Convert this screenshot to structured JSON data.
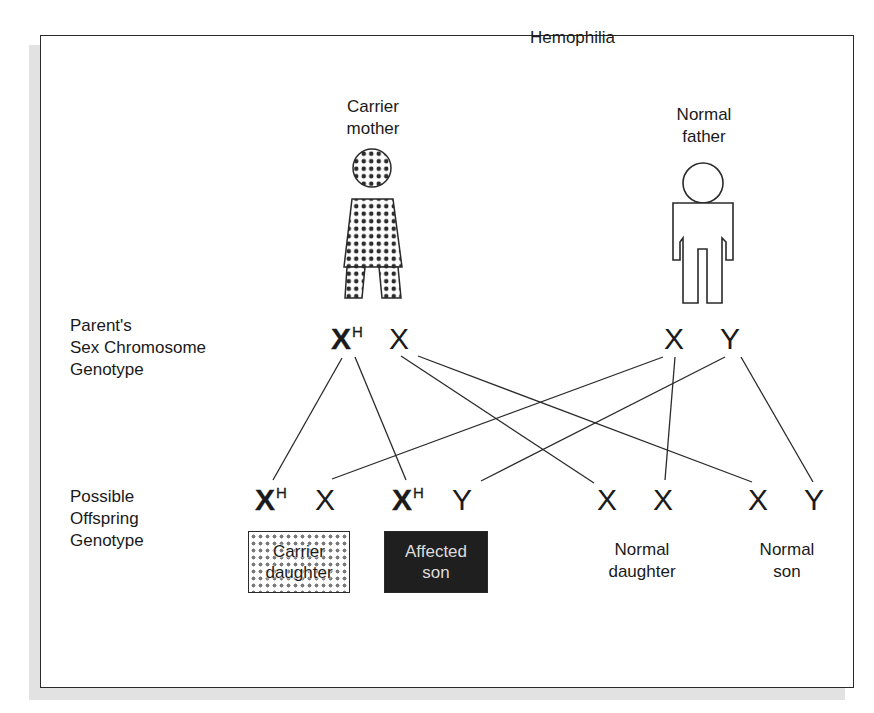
{
  "title": "Hemophilia",
  "parents": {
    "mother": {
      "label_line1": "Carrier",
      "label_line2": "mother",
      "pattern": "dotted"
    },
    "father": {
      "label_line1": "Normal",
      "label_line2": "father",
      "pattern": "outline"
    }
  },
  "row_labels": {
    "parent_genotype": {
      "line1": "Parent's",
      "line2": "Sex Chromosome",
      "line3": "Genotype"
    },
    "offspring_genotype": {
      "line1": "Possible",
      "line2": "Offspring",
      "line3": "Genotype"
    }
  },
  "parent_chromosomes": {
    "mother": [
      {
        "letter": "X",
        "sup": "H"
      },
      {
        "letter": "X",
        "sup": ""
      }
    ],
    "father": [
      {
        "letter": "X",
        "sup": ""
      },
      {
        "letter": "Y",
        "sup": ""
      }
    ]
  },
  "offspring": [
    {
      "chromosomes": [
        {
          "letter": "X",
          "sup": "H"
        },
        {
          "letter": "X",
          "sup": ""
        }
      ],
      "label_line1": "Carrier",
      "label_line2": "daughter",
      "style": "carrier-box"
    },
    {
      "chromosomes": [
        {
          "letter": "X",
          "sup": "H"
        },
        {
          "letter": "Y",
          "sup": ""
        }
      ],
      "label_line1": "Affected",
      "label_line2": "son",
      "style": "affected-box"
    },
    {
      "chromosomes": [
        {
          "letter": "X",
          "sup": ""
        },
        {
          "letter": "X",
          "sup": ""
        }
      ],
      "label_line1": "Normal",
      "label_line2": "daughter",
      "style": "plain"
    },
    {
      "chromosomes": [
        {
          "letter": "X",
          "sup": ""
        },
        {
          "letter": "Y",
          "sup": ""
        }
      ],
      "label_line1": "Normal",
      "label_line2": "son",
      "style": "plain"
    }
  ],
  "inheritance_lines": [
    {
      "from": "mother.XH",
      "to": "offspring0.XH"
    },
    {
      "from": "mother.XH",
      "to": "offspring1.XH"
    },
    {
      "from": "mother.X",
      "to": "offspring2.X1"
    },
    {
      "from": "mother.X",
      "to": "offspring3.X"
    },
    {
      "from": "father.X",
      "to": "offspring0.X"
    },
    {
      "from": "father.X",
      "to": "offspring2.X2"
    },
    {
      "from": "father.Y",
      "to": "offspring1.Y"
    },
    {
      "from": "father.Y",
      "to": "offspring3.Y"
    }
  ],
  "colors": {
    "line": "#2a2a2a",
    "dots": "#7a7a7a",
    "affected_fill": "#1f1f1f",
    "affected_text": "#dcdcdc",
    "shadow": "#e2e2e2"
  }
}
